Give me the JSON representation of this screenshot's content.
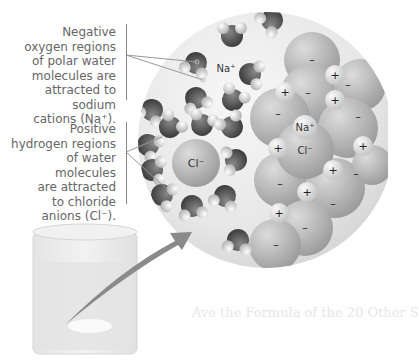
{
  "figure": {
    "callouts": [
      {
        "id": "oxygen-callout",
        "lines": [
          "Negative",
          "oxygen regions",
          "of polar water",
          "molecules are",
          "attracted to sodium",
          "cations (Na⁺)."
        ]
      },
      {
        "id": "hydrogen-callout",
        "lines": [
          "Positive",
          "hydrogen regions",
          "of water molecules",
          "are attracted",
          "to chloride",
          "anions (Cl⁻)."
        ]
      }
    ],
    "ion_labels": {
      "sodium_water": "Na⁺",
      "chloride_water": "Cl⁻",
      "sodium_crystal": "Na⁺",
      "chloride_crystal": "Cl⁻"
    },
    "charge_signs": {
      "plus": "+",
      "minus": "–"
    },
    "bleed_through_text": [
      "Ave the Formula of the 20 Other S"
    ],
    "colors": {
      "background": "#ffffff",
      "text": "#666666",
      "oxygen": "#5a5a5a",
      "hydrogen": "#d8d8d8",
      "sodium_ion": "#bdbdbd",
      "chloride_ion": "#a8a8a8",
      "arrow": "#8a8a8a",
      "beaker": "#e2e2e2",
      "zoom_circle": "#ebebeb"
    }
  }
}
